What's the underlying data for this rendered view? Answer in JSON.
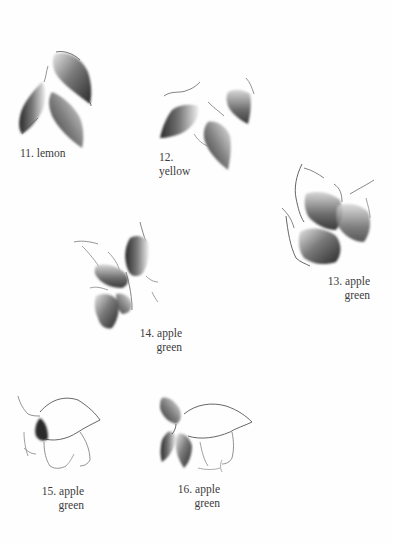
{
  "page": {
    "background": "#fefefe",
    "ink_color": "#3b3b3b"
  },
  "figures": [
    {
      "number": "11.",
      "color_name": "lemon",
      "caption_lines": [
        "11.  lemon"
      ]
    },
    {
      "number": "12.",
      "color_name": "yellow",
      "caption_lines": [
        "12.",
        "yellow"
      ]
    },
    {
      "number": "13.",
      "color_name": "apple green",
      "caption_lines": [
        "13.  apple",
        "green"
      ]
    },
    {
      "number": "14.",
      "color_name": "apple green",
      "caption_lines": [
        "14.  apple",
        "green"
      ]
    },
    {
      "number": "15.",
      "color_name": "apple green",
      "caption_lines": [
        "15.  apple",
        "green"
      ]
    },
    {
      "number": "16.",
      "color_name": "apple green",
      "caption_lines": [
        "16.  apple",
        "green"
      ]
    }
  ]
}
